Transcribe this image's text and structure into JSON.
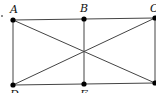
{
  "diagram": {
    "type": "geometry-figure",
    "points": [
      {
        "id": "A",
        "label": "A",
        "x": 13,
        "y": 20
      },
      {
        "id": "B",
        "label": "B",
        "x": 84,
        "y": 19
      },
      {
        "id": "C",
        "label": "C",
        "x": 155,
        "y": 18
      },
      {
        "id": "D",
        "label": "D",
        "x": 13,
        "y": 85
      },
      {
        "id": "E",
        "label": "E",
        "x": 84,
        "y": 84
      },
      {
        "id": "F",
        "label": "",
        "x": 155,
        "y": 83
      }
    ],
    "segments": [
      [
        "A",
        "C"
      ],
      [
        "D",
        "F"
      ],
      [
        "A",
        "D"
      ],
      [
        "B",
        "E"
      ],
      [
        "C",
        "F"
      ],
      [
        "A",
        "F"
      ],
      [
        "D",
        "C"
      ]
    ],
    "stray_mark": {
      "x": 2,
      "y": 16
    },
    "colors": {
      "line": "#444444",
      "point": "#000000",
      "background": "#ffffff"
    }
  }
}
